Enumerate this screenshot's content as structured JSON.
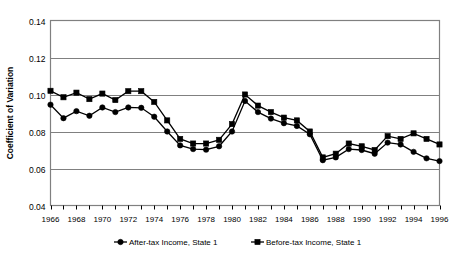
{
  "chart_data": {
    "type": "line",
    "title": "",
    "xlabel": "",
    "ylabel": "Coefficient of Variation",
    "ylim": [
      0.04,
      0.14
    ],
    "ytick_labels": [
      "0.14",
      "0.12",
      "0.10",
      "0.08",
      "0.06",
      "0.04"
    ],
    "ytick_values": [
      0.14,
      0.12,
      0.1,
      0.08,
      0.06,
      0.04
    ],
    "grid": "horizontal",
    "legend_position": "bottom",
    "x": [
      1966,
      1967,
      1968,
      1969,
      1970,
      1971,
      1972,
      1973,
      1974,
      1975,
      1976,
      1977,
      1978,
      1979,
      1980,
      1981,
      1982,
      1983,
      1984,
      1985,
      1986,
      1987,
      1988,
      1989,
      1990,
      1991,
      1992,
      1993,
      1994,
      1995,
      1996
    ],
    "xtick_labels": [
      "1966",
      "1968",
      "1970",
      "1972",
      "1974",
      "1976",
      "1978",
      "1980",
      "1982",
      "1984",
      "1986",
      "1988",
      "1990",
      "1992",
      "1994",
      "1996"
    ],
    "xtick_values": [
      1966,
      1968,
      1970,
      1972,
      1974,
      1976,
      1978,
      1980,
      1982,
      1984,
      1986,
      1988,
      1990,
      1992,
      1994,
      1996
    ],
    "xlim": [
      1966,
      1996
    ],
    "series": [
      {
        "name": "After-tax Income, State 1",
        "marker": "circle",
        "values": [
          0.0945,
          0.0872,
          0.091,
          0.0885,
          0.093,
          0.0905,
          0.093,
          0.0928,
          0.088,
          0.08,
          0.0725,
          0.0705,
          0.0702,
          0.072,
          0.08,
          0.0965,
          0.0905,
          0.087,
          0.0845,
          0.083,
          0.0785,
          0.0645,
          0.066,
          0.0705,
          0.07,
          0.068,
          0.074,
          0.073,
          0.069,
          0.0655,
          0.064
        ]
      },
      {
        "name": "Before-tax Income, State 1",
        "marker": "square",
        "values": [
          0.102,
          0.0985,
          0.101,
          0.0975,
          0.1005,
          0.097,
          0.1018,
          0.1018,
          0.096,
          0.086,
          0.076,
          0.0735,
          0.0735,
          0.0755,
          0.084,
          0.1,
          0.094,
          0.0905,
          0.0875,
          0.086,
          0.08,
          0.066,
          0.068,
          0.0735,
          0.072,
          0.07,
          0.0775,
          0.076,
          0.079,
          0.076,
          0.073
        ]
      }
    ]
  },
  "legend": {
    "items": [
      {
        "label": "After-tax Income, State 1",
        "marker": "circle"
      },
      {
        "label": "Before-tax Income, State 1",
        "marker": "square"
      }
    ]
  },
  "axes": {
    "y_title": "Coefficient of Variation"
  }
}
